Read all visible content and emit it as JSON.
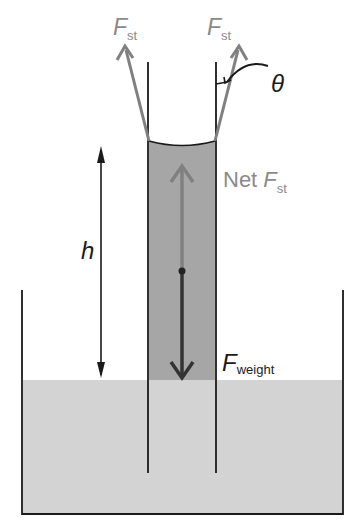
{
  "diagram": {
    "labels": {
      "fst_left_main": "F",
      "fst_left_sub": "st",
      "fst_right_main": "F",
      "fst_right_sub": "st",
      "theta": "θ",
      "net_prefix": "Net ",
      "net_main": "F",
      "net_sub": "st",
      "h": "h",
      "weight_main": "F",
      "weight_sub": "weight"
    },
    "colors": {
      "water": "#d3d3d3",
      "column": "#a6a6a6",
      "line": "#1a1a1a",
      "force_gray": "#808080",
      "weight_arrow": "#333333",
      "label_gray": "#8a8a8a"
    }
  }
}
